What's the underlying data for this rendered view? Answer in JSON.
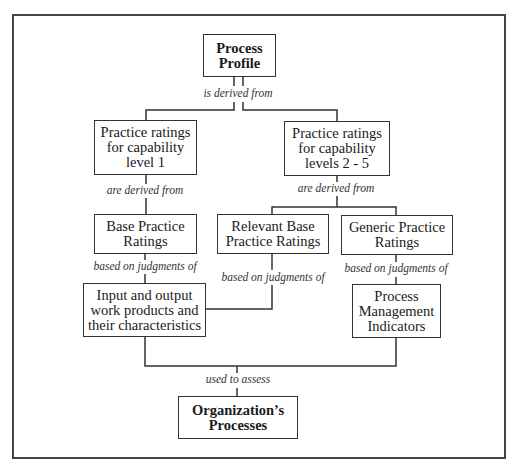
{
  "nodes": {
    "process_profile": "Process\nProfile",
    "practice_level1": "Practice ratings\nfor capability\nlevel 1",
    "practice_levels2_5": "Practice ratings\nfor capability\nlevels 2 - 5",
    "base_practice": "Base Practice\nRatings",
    "relevant_base": "Relevant Base\nPractice Ratings",
    "generic_practice": "Generic Practice\nRatings",
    "input_output": "Input and output\nwork products and\ntheir characteristics",
    "process_mgmt": "Process\nManagement\nIndicators",
    "organization": "Organization’s\nProcesses"
  },
  "edges": {
    "is_derived_from": "is derived from",
    "are_derived_from_left": "are derived from",
    "are_derived_from_right": "are derived from",
    "based_on_base": "based on judgments of",
    "based_on_relevant": "based on judgments of",
    "based_on_generic": "based on judgments of",
    "used_to_assess": "used to assess"
  }
}
